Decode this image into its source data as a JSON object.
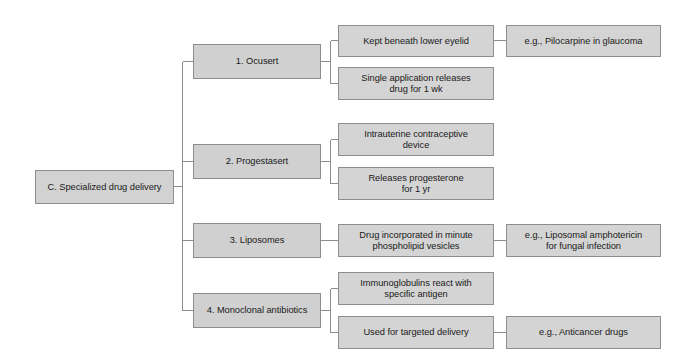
{
  "diagram": {
    "type": "hierarchical-flowchart",
    "orientation": "left-to-right",
    "title": "C. Specialized drug delivery",
    "colors": {
      "box_fill": "#d2d2d2",
      "box_border": "#8d8d8d",
      "connector": "#8d8d8d",
      "text": "#1a1a1a",
      "background": "#ffffff"
    },
    "root": {
      "label": "C. Specialized drug delivery"
    },
    "branches": [
      {
        "label": "1. Ocusert",
        "details": [
          {
            "label": "Kept beneath lower eyelid",
            "example": "e.g., Pilocarpine in glaucoma"
          },
          {
            "label": "Single application releases\ndrug for 1 wk",
            "example": null
          }
        ]
      },
      {
        "label": "2. Progestasert",
        "details": [
          {
            "label": "Intrauterine contraceptive\ndevice",
            "example": null
          },
          {
            "label": "Releases progesterone\nfor 1 yr",
            "example": null
          }
        ]
      },
      {
        "label": "3. Liposomes",
        "details": [
          {
            "label": "Drug incorporated in minute\nphospholipid vesicles",
            "example": "e.g., Liposomal amphotericin\nfor fungal infection"
          }
        ]
      },
      {
        "label": "4. Monoclonal antibiotics",
        "details": [
          {
            "label": "Immunoglobulins react with\nspecific antigen",
            "example": null
          },
          {
            "label": "Used for targeted delivery",
            "example": "e.g., Anticancer drugs"
          }
        ]
      }
    ],
    "nodes": {
      "root": "C. Specialized drug delivery",
      "b1": "1. Ocusert",
      "b2": "2. Progestasert",
      "b3": "3. Liposomes",
      "b4": "4. Monoclonal antibiotics",
      "d1a": "Kept beneath lower eyelid",
      "d1b": "Single application releases\ndrug for 1 wk",
      "d2a": "Intrauterine contraceptive\ndevice",
      "d2b": "Releases progesterone\nfor 1 yr",
      "d3a": "Drug incorporated in minute\nphospholipid vesicles",
      "d4a": "Immunoglobulins react with\nspecific antigen",
      "d4b": "Used for targeted delivery",
      "e1a": "e.g., Pilocarpine in glaucoma",
      "e3a": "e.g., Liposomal amphotericin\nfor fungal infection",
      "e4b": "e.g., Anticancer drugs"
    }
  }
}
